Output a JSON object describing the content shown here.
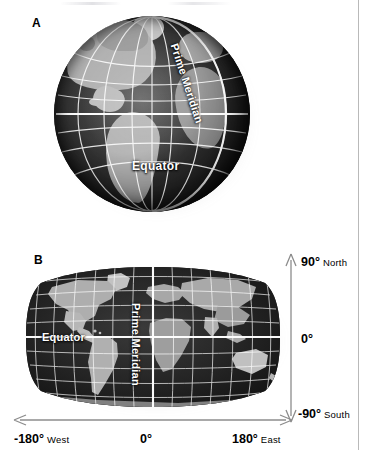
{
  "figure": {
    "panels": [
      {
        "letter": "A",
        "type": "globe",
        "labels": {
          "equator": "Equator",
          "prime_meridian": "Prime Meridian"
        }
      },
      {
        "letter": "B",
        "type": "robinson-projection-map",
        "labels": {
          "equator": "Equator",
          "prime_meridian": "Prime Meridian"
        }
      }
    ]
  },
  "axes": {
    "latitude": {
      "top": {
        "degrees": "90°",
        "direction": "North"
      },
      "middle": {
        "degrees": "0°",
        "direction": ""
      },
      "bottom": {
        "degrees": "-90°",
        "direction": "South"
      }
    },
    "longitude": {
      "left": {
        "degrees": "-180°",
        "direction": "West"
      },
      "center": {
        "degrees": "0°",
        "direction": ""
      },
      "right": {
        "degrees": "180°",
        "direction": "East"
      }
    }
  },
  "colors": {
    "background": "#ffffff",
    "ocean_dark": "#232323",
    "land_gray": "#b7b7b7",
    "graticule": "#ffffff",
    "axis_gray": "#8c8c8c",
    "text": "#000000",
    "page_rule": "#b9b9b9"
  }
}
